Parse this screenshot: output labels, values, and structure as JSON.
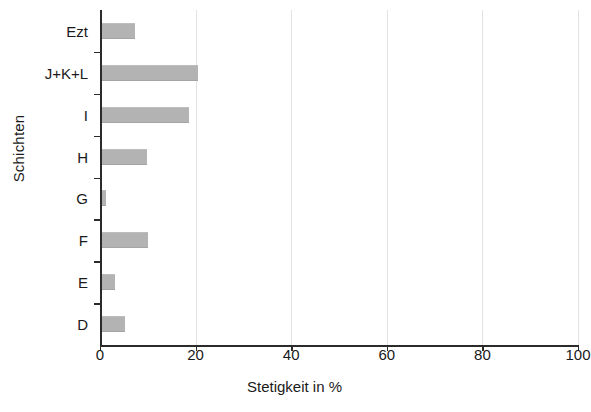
{
  "chart_data": {
    "type": "bar",
    "orientation": "horizontal",
    "title": "",
    "xlabel": "Stetigkeit in %",
    "ylabel": "Schichten",
    "categories": [
      "Ezt",
      "J+K+L",
      "I",
      "H",
      "G",
      "F",
      "E",
      "D"
    ],
    "values": [
      6.9,
      20.1,
      18.2,
      9.4,
      1.0,
      9.8,
      2.9,
      4.8
    ],
    "xlim": [
      0,
      100
    ],
    "xticks": [
      0,
      20,
      40,
      60,
      80,
      100
    ],
    "xtick_labels": [
      "0",
      "20",
      "40",
      "60",
      "80",
      "100"
    ],
    "grid": "vertical-light",
    "legend": "none",
    "bar_color": "#b3b3b3",
    "axis_color": "#2b2b2b",
    "gridline_color": "#e2e2e2"
  }
}
